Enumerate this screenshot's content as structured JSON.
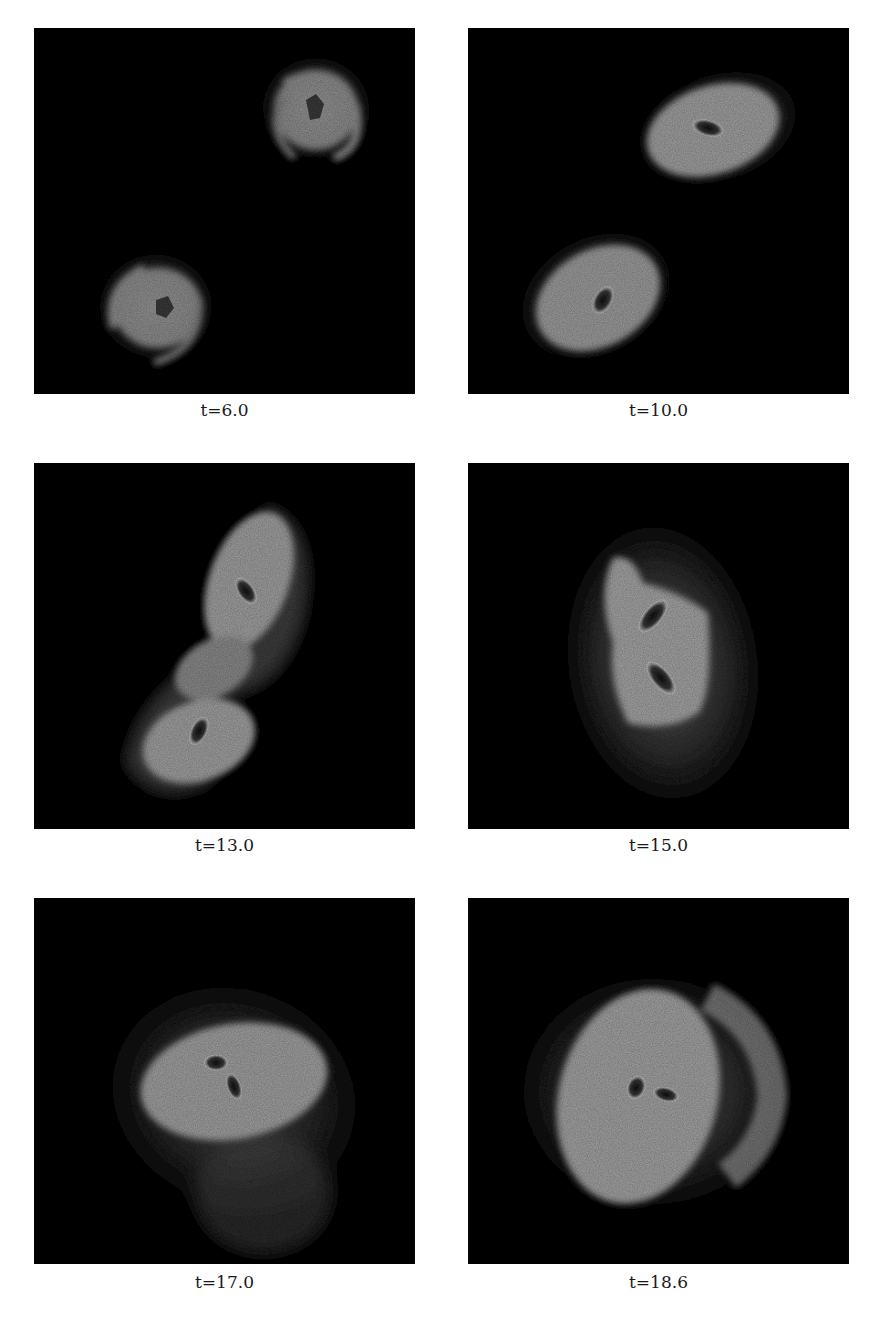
{
  "figure": {
    "layout": {
      "rows": 3,
      "cols": 2
    },
    "panels": [
      {
        "caption": "t=6.0",
        "state": "two separated spiral disks (upper right, lower left)"
      },
      {
        "caption": "t=10.0",
        "state": "two disks approaching, elongated with dark nuclei"
      },
      {
        "caption": "t=13.0",
        "state": "disks interacting with connecting bridge, S-shaped"
      },
      {
        "caption": "t=15.0",
        "state": "overlapping disks, two nuclei close together"
      },
      {
        "caption": "t=17.0",
        "state": "merged remnant with two nuclei, extended halo"
      },
      {
        "caption": "t=18.6",
        "state": "merged remnant with nearly coalesced nuclei"
      }
    ],
    "colors": {
      "background": "#060606",
      "disk": "#a8a8a8",
      "halo": "#4a4a4a",
      "nucleus": "#1c1c1c"
    }
  }
}
